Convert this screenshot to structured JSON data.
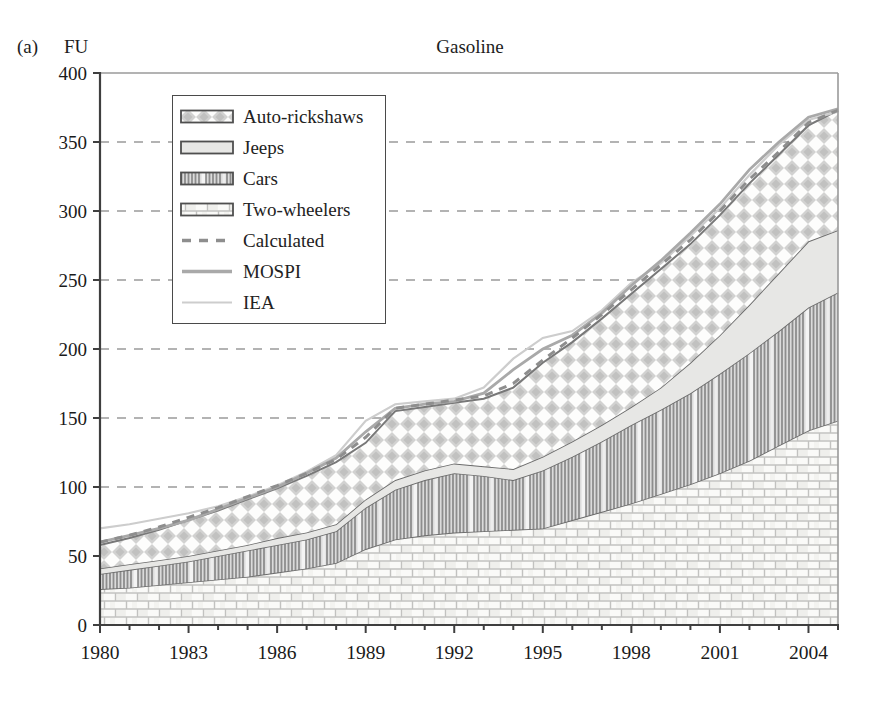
{
  "page": {
    "panel_label": "(a)",
    "y_axis_unit": "FU",
    "title": "Gasoline"
  },
  "legend": {
    "items": [
      {
        "label": "Auto-rickshaws",
        "swatch": "diamond-pattern"
      },
      {
        "label": "Jeeps",
        "swatch": "plain-gray"
      },
      {
        "label": "Cars",
        "swatch": "vertical-stripes"
      },
      {
        "label": "Two-wheelers",
        "swatch": "brick-pattern"
      },
      {
        "label": "Calculated",
        "swatch": "dashed-line"
      },
      {
        "label": "MOSPI",
        "swatch": "solid-line"
      },
      {
        "label": "IEA",
        "swatch": "light-line"
      }
    ]
  },
  "colors": {
    "edge": "#6b6b6b",
    "stack_top_edge": "#787878",
    "calculated_line": "#8e8e8e",
    "mospi_line": "#a9a9a9",
    "iea_line": "#cdcdcd",
    "grid": "#b3b3b3",
    "axis_dark": "#3f3f3f",
    "frame_light": "#9a9a9a",
    "jeep_fill": "#e7e7e5"
  },
  "chart_data": {
    "type": "area",
    "stacked": true,
    "title": "Gasoline",
    "xlabel": "",
    "ylabel": "FU",
    "ylim": [
      0,
      400
    ],
    "grid": "dashed-horizontal",
    "legend_position": "top-left-inside",
    "x": [
      1980,
      1981,
      1982,
      1983,
      1984,
      1985,
      1986,
      1987,
      1988,
      1989,
      1990,
      1991,
      1992,
      1993,
      1994,
      1995,
      1996,
      1997,
      1998,
      1999,
      2000,
      2001,
      2002,
      2003,
      2004,
      2005
    ],
    "xtick_labels": [
      "1980",
      "1983",
      "1986",
      "1989",
      "1992",
      "1995",
      "1998",
      "2001",
      "2004"
    ],
    "xtick_years": [
      1980,
      1983,
      1986,
      1989,
      1992,
      1995,
      1998,
      2001,
      2004
    ],
    "yticks": [
      0,
      50,
      100,
      150,
      200,
      250,
      300,
      350,
      400
    ],
    "series": [
      {
        "name": "Two-wheelers",
        "type": "area",
        "pattern": "brick",
        "values": [
          26,
          27,
          29,
          31,
          33,
          35,
          38,
          41,
          45,
          55,
          62,
          65,
          67,
          68,
          69,
          70,
          76,
          82,
          88,
          95,
          102,
          110,
          119,
          130,
          141,
          148
        ]
      },
      {
        "name": "Cars",
        "type": "area",
        "pattern": "stripes",
        "values": [
          11,
          13,
          14,
          15,
          17,
          19,
          20,
          21,
          23,
          30,
          36,
          40,
          43,
          40,
          36,
          42,
          46,
          51,
          57,
          61,
          66,
          72,
          78,
          83,
          89,
          93
        ]
      },
      {
        "name": "Jeeps",
        "type": "area",
        "pattern": "plain",
        "values": [
          4,
          4,
          4,
          4,
          4,
          4,
          5,
          5,
          5,
          6,
          7,
          7,
          7,
          7,
          8,
          10,
          11,
          12,
          13,
          16,
          22,
          28,
          35,
          42,
          48,
          45
        ]
      },
      {
        "name": "Auto-rickshaws",
        "type": "area",
        "pattern": "diamond",
        "values": [
          17,
          19,
          22,
          26,
          29,
          33,
          36,
          41,
          45,
          41,
          50,
          46,
          44,
          49,
          59,
          68,
          72,
          77,
          82,
          86,
          86,
          87,
          88,
          86,
          84,
          87
        ]
      },
      {
        "name": "Calculated",
        "type": "line",
        "line_style": "dashed",
        "values": [
          60,
          65,
          71,
          78,
          85,
          93,
          101,
          110,
          120,
          136,
          157,
          160,
          163,
          166,
          175,
          192,
          208,
          225,
          243,
          261,
          279,
          300,
          323,
          343,
          364,
          373
        ]
      },
      {
        "name": "MOSPI",
        "type": "line",
        "line_style": "solid",
        "values": [
          60,
          65,
          70,
          76,
          84,
          92,
          100,
          110,
          121,
          140,
          157,
          160,
          162,
          168,
          185,
          200,
          210,
          226,
          246,
          264,
          284,
          305,
          330,
          350,
          368,
          374
        ]
      },
      {
        "name": "IEA",
        "type": "line",
        "line_style": "light",
        "values": [
          70,
          73,
          77,
          81,
          86,
          93,
          101,
          111,
          123,
          148,
          160,
          162,
          164,
          172,
          193,
          208,
          213,
          228,
          248,
          262,
          282,
          302,
          326,
          348,
          366,
          372
        ]
      }
    ]
  }
}
